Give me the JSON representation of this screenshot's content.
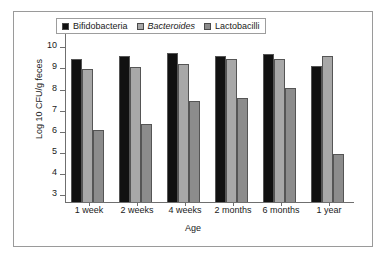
{
  "chart_data": {
    "type": "bar",
    "title": "",
    "xlabel": "Age",
    "ylabel": "Log 10 CFU/g feces",
    "categories": [
      "1 week",
      "2 weeks",
      "4 weeks",
      "2 months",
      "6 months",
      "1 year"
    ],
    "ylim": [
      2.7,
      10.4
    ],
    "yticks": [
      3,
      4,
      5,
      6,
      7,
      8,
      9,
      10
    ],
    "ytick_labels": [
      "3",
      "4",
      "5",
      "6",
      "7",
      "8",
      "9",
      "10"
    ],
    "grid": false,
    "legend_position": "top-left-inside",
    "series": [
      {
        "name": "Bifidobacteria",
        "color": "#111111",
        "italic": false,
        "values": [
          9.5,
          9.65,
          9.8,
          9.62,
          9.73,
          9.17
        ]
      },
      {
        "name": "Bacteroides",
        "color": "#a8a8a8",
        "italic": true,
        "values": [
          9.0,
          9.12,
          9.27,
          9.48,
          9.48,
          9.65
        ]
      },
      {
        "name": "Lactobacilli",
        "color": "#8c8c8c",
        "italic": false,
        "values": [
          6.1,
          6.42,
          7.5,
          7.65,
          8.13,
          5.0
        ]
      }
    ]
  }
}
